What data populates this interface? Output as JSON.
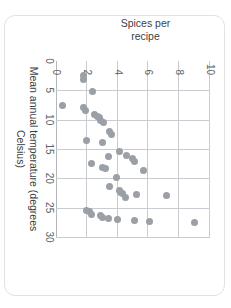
{
  "figure": {
    "background_color": "#ffffff",
    "card_border_color": "#e2e2e2"
  },
  "chart_data": {
    "type": "scatter",
    "title": "",
    "xlabel_line1": "Mean annual temperature",
    "xlabel_line2": "(degrees Celsius)",
    "ylabel_line1": "Spices per",
    "ylabel_line2": "recipe",
    "xlim": [
      0,
      30
    ],
    "ylim": [
      0,
      10
    ],
    "xticks": [
      0,
      5,
      10,
      15,
      20,
      25,
      30
    ],
    "xtick_labels": [
      "0",
      "5",
      "10",
      "15",
      "20",
      "25",
      "30"
    ],
    "yticks": [
      0,
      2,
      4,
      6,
      8,
      10
    ],
    "ytick_labels": [
      "0",
      "2",
      "4",
      "6",
      "8",
      "10"
    ],
    "grid": true,
    "grid_color": "#c9cdd2",
    "marker_color": "#9aa0a6",
    "marker_size": 7,
    "legend": null,
    "points": [
      {
        "x": 2.4,
        "y": 1.8
      },
      {
        "x": 3.2,
        "y": 1.8
      },
      {
        "x": 5.2,
        "y": 2.4
      },
      {
        "x": 7.6,
        "y": 0.4
      },
      {
        "x": 8.0,
        "y": 1.8
      },
      {
        "x": 8.4,
        "y": 1.9
      },
      {
        "x": 9.2,
        "y": 2.5
      },
      {
        "x": 9.4,
        "y": 2.7
      },
      {
        "x": 9.6,
        "y": 2.8
      },
      {
        "x": 10.1,
        "y": 2.9
      },
      {
        "x": 10.4,
        "y": 3.1
      },
      {
        "x": 12.1,
        "y": 3.5
      },
      {
        "x": 12.6,
        "y": 3.6
      },
      {
        "x": 13.5,
        "y": 2.0
      },
      {
        "x": 13.9,
        "y": 3.0
      },
      {
        "x": 15.4,
        "y": 4.1
      },
      {
        "x": 16.1,
        "y": 4.6
      },
      {
        "x": 16.3,
        "y": 3.4
      },
      {
        "x": 16.6,
        "y": 5.0
      },
      {
        "x": 17.1,
        "y": 5.1
      },
      {
        "x": 17.4,
        "y": 2.3
      },
      {
        "x": 18.1,
        "y": 3.0
      },
      {
        "x": 18.4,
        "y": 3.2
      },
      {
        "x": 18.6,
        "y": 5.7
      },
      {
        "x": 19.9,
        "y": 3.9
      },
      {
        "x": 21.4,
        "y": 3.5
      },
      {
        "x": 22.1,
        "y": 4.1
      },
      {
        "x": 22.4,
        "y": 4.2
      },
      {
        "x": 22.6,
        "y": 4.3
      },
      {
        "x": 22.8,
        "y": 5.2
      },
      {
        "x": 23.0,
        "y": 7.2
      },
      {
        "x": 23.2,
        "y": 4.5
      },
      {
        "x": 25.4,
        "y": 2.0
      },
      {
        "x": 25.7,
        "y": 2.2
      },
      {
        "x": 26.1,
        "y": 2.3
      },
      {
        "x": 26.4,
        "y": 2.9
      },
      {
        "x": 26.7,
        "y": 3.0
      },
      {
        "x": 26.9,
        "y": 3.4
      },
      {
        "x": 27.0,
        "y": 4.0
      },
      {
        "x": 27.2,
        "y": 5.1
      },
      {
        "x": 27.4,
        "y": 6.1
      },
      {
        "x": 27.6,
        "y": 9.0
      }
    ]
  }
}
